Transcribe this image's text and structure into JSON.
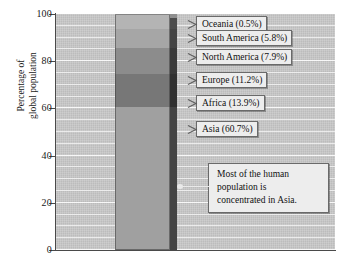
{
  "chart_data": {
    "type": "bar",
    "subtype": "stacked-single-bar",
    "title": "",
    "xlabel": "",
    "ylabel": "Percentage of global population",
    "ylabel_lines": [
      "Percentage of",
      "global population"
    ],
    "ylim": [
      0,
      100
    ],
    "yticks": [
      0,
      20,
      40,
      60,
      80,
      100
    ],
    "ytick_labels": [
      "0",
      "20",
      "40",
      "60",
      "80",
      "100"
    ],
    "minor_gridline_step": 5,
    "grid": true,
    "legend": "callout-labels-right",
    "categories": [
      "Global population"
    ],
    "series": [
      {
        "name": "Asia",
        "value": 60.7,
        "label": "Asia (60.7%)",
        "color": "#a0a0a0",
        "side_color": "#6e6e6e"
      },
      {
        "name": "Africa",
        "value": 13.9,
        "label": "Africa (13.9%)",
        "color": "#777777",
        "side_color": "#4f4f4f"
      },
      {
        "name": "Europe",
        "value": 11.2,
        "label": "Europe (11.2%)",
        "color": "#8c8c8c",
        "side_color": "#5e5e5e"
      },
      {
        "name": "North America",
        "value": 7.9,
        "label": "North America (7.9%)",
        "color": "#a6a6a6",
        "side_color": "#6e6e6e"
      },
      {
        "name": "South America",
        "value": 5.8,
        "label": "South America (5.8%)",
        "color": "#b4b4b4",
        "side_color": "#7b7b7b"
      },
      {
        "name": "Oceania",
        "value": 0.5,
        "label": "Oceania (0.5%)",
        "color": "#dcdcdc",
        "side_color": "#969696"
      }
    ],
    "annotations": [
      {
        "text": "Most of the human population is concentrated in Asia.",
        "lines": [
          "Most of the human",
          "population is",
          "concentrated in Asia."
        ],
        "points_to": "Asia"
      }
    ],
    "colors": {
      "plot_background": "#c9c9c9",
      "gridline": "#f4f4f4",
      "axis": "#4a4a4a",
      "callout_background": "#ededed",
      "callout_border": "#6a6a6a",
      "text": "#111111",
      "page_background": "#ffffff"
    }
  }
}
